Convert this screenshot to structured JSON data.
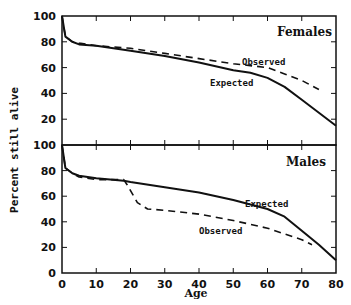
{
  "chart_data": [
    {
      "type": "line",
      "panel": "top",
      "title": "Females",
      "xlabel": "Age",
      "ylabel": "Percent still alive",
      "xlim": [
        0,
        80
      ],
      "ylim": [
        0,
        100
      ],
      "xticks": [
        0,
        10,
        20,
        30,
        40,
        50,
        60,
        70,
        80
      ],
      "yticks": [
        20,
        40,
        60,
        80,
        100
      ],
      "grid": false,
      "series": [
        {
          "name": "Expected",
          "style": "solid",
          "x": [
            0,
            1,
            3,
            5,
            10,
            20,
            30,
            40,
            50,
            55,
            60,
            65,
            70,
            75,
            80
          ],
          "values": [
            100,
            84,
            80,
            78,
            77,
            73,
            69,
            64,
            58,
            56,
            52,
            45,
            35,
            25,
            15
          ]
        },
        {
          "name": "Observed",
          "style": "dashed",
          "x": [
            0,
            1,
            3,
            5,
            10,
            20,
            30,
            40,
            50,
            60,
            65,
            70,
            75
          ],
          "values": [
            100,
            84,
            80,
            79,
            77,
            75,
            71,
            67,
            63,
            60,
            55,
            50,
            43
          ]
        }
      ],
      "annotations": [
        {
          "text": "Observed",
          "x": 55,
          "y": 65
        },
        {
          "text": "Expected",
          "x": 45,
          "y": 55
        }
      ]
    },
    {
      "type": "line",
      "panel": "bottom",
      "title": "Males",
      "xlabel": "Age",
      "ylabel": "Percent still alive",
      "xlim": [
        0,
        80
      ],
      "ylim": [
        0,
        100
      ],
      "xticks": [
        0,
        10,
        20,
        30,
        40,
        50,
        60,
        70,
        80
      ],
      "yticks": [
        0,
        20,
        40,
        60,
        80,
        100
      ],
      "grid": false,
      "series": [
        {
          "name": "Expected",
          "style": "solid",
          "x": [
            0,
            1,
            3,
            5,
            10,
            18,
            20,
            30,
            40,
            50,
            60,
            65,
            70,
            75,
            80
          ],
          "values": [
            100,
            82,
            78,
            76,
            74,
            72,
            71,
            67,
            63,
            57,
            50,
            44,
            33,
            22,
            10
          ]
        },
        {
          "name": "Observed",
          "style": "dashed",
          "x": [
            0,
            1,
            3,
            5,
            10,
            18,
            19,
            22,
            25,
            30,
            40,
            50,
            60,
            70,
            73
          ],
          "values": [
            100,
            82,
            78,
            75,
            73,
            73,
            69,
            55,
            50,
            49,
            46,
            41,
            35,
            26,
            22
          ]
        }
      ],
      "annotations": [
        {
          "text": "Expected",
          "x": 60,
          "y": 57
        },
        {
          "text": "Observed",
          "x": 36,
          "y": 38
        }
      ]
    }
  ],
  "labels": {
    "ylabel": "Percent still alive",
    "xlabel": "Age",
    "females_title": "Females",
    "males_title": "Males",
    "observed": "Observed",
    "expected": "Expected"
  },
  "ticks": {
    "x": [
      "0",
      "10",
      "20",
      "30",
      "40",
      "50",
      "60",
      "70",
      "80"
    ],
    "top_y": [
      "100",
      "80",
      "60",
      "40",
      "20"
    ],
    "bottom_y": [
      "100",
      "80",
      "60",
      "40",
      "20",
      "0"
    ]
  }
}
